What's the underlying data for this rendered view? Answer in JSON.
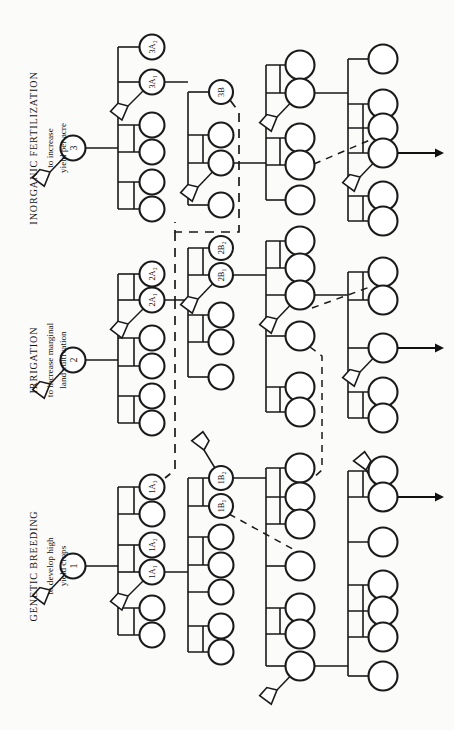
{
  "figure": {
    "kind": "relevance-tree",
    "orientation": "rotated-90-counterclockwise",
    "background_color": "#fbfbfa",
    "ink_color": "#1a1a1a",
    "width": 454,
    "height": 730
  },
  "branches": [
    {
      "id": "branch-3",
      "root_label": "3",
      "title": "INORGANIC  FERTILIZATION",
      "objective_line1": "to increase",
      "objective_line2": "yield per acre",
      "level_a_labels": [
        "3A₂",
        "3A₁"
      ],
      "level_b_labels": [
        "3B"
      ]
    },
    {
      "id": "branch-2",
      "root_label": "2",
      "title": "IRRIGATION",
      "objective_line1": "to increase marginal",
      "objective_line2": "land cultivation",
      "level_a_labels": [
        "2A₂",
        "2A₁"
      ],
      "level_b_labels": [
        "2B₂",
        "2B₁"
      ]
    },
    {
      "id": "branch-1",
      "root_label": "1",
      "title": "GENETIC  BREEDING",
      "objective_line1": "to develop high",
      "objective_line2": "yield crops",
      "level_a_labels": [
        "1A₃",
        "1A₂",
        "1A₁"
      ],
      "level_b_labels": [
        "1B₂",
        "1B₁"
      ]
    }
  ],
  "labeled_nodes": [
    {
      "label": "3",
      "cx": 73,
      "cy": 148,
      "r": 12.5,
      "font": 10
    },
    {
      "label": "3A₂",
      "cx": 152,
      "cy": 47,
      "r": 12.5,
      "font": 8.4
    },
    {
      "label": "3A₁",
      "cx": 152,
      "cy": 82,
      "r": 12.5,
      "font": 8.4
    },
    {
      "label": "3B",
      "cx": 221,
      "cy": 92,
      "r": 12.0,
      "font": 8.4
    },
    {
      "label": "2",
      "cx": 73,
      "cy": 360,
      "r": 12.5,
      "font": 10
    },
    {
      "label": "2A₂",
      "cx": 152,
      "cy": 274,
      "r": 12.5,
      "font": 8.4
    },
    {
      "label": "2A₁",
      "cx": 152,
      "cy": 300,
      "r": 12.5,
      "font": 8.4
    },
    {
      "label": "2B₂",
      "cx": 221,
      "cy": 248,
      "r": 12.0,
      "font": 8.4
    },
    {
      "label": "2B₁",
      "cx": 221,
      "cy": 275,
      "r": 12.0,
      "font": 8.4
    },
    {
      "label": "1",
      "cx": 73,
      "cy": 566,
      "r": 12.5,
      "font": 10
    },
    {
      "label": "1A₃",
      "cx": 152,
      "cy": 487,
      "r": 12.5,
      "font": 8.4
    },
    {
      "label": "1A₂",
      "cx": 152,
      "cy": 545,
      "r": 12.5,
      "font": 8.4
    },
    {
      "label": "1A₁",
      "cx": 152,
      "cy": 572,
      "r": 12.5,
      "font": 8.4
    },
    {
      "label": "1B₂",
      "cx": 221,
      "cy": 478,
      "r": 12.0,
      "font": 8.4
    },
    {
      "label": "1B₁",
      "cx": 221,
      "cy": 506,
      "r": 12.0,
      "font": 8.4
    }
  ],
  "plain_nodes": [
    {
      "cx": 152,
      "cy": 125,
      "r": 12.5
    },
    {
      "cx": 152,
      "cy": 152,
      "r": 12.5
    },
    {
      "cx": 152,
      "cy": 182,
      "r": 12.5
    },
    {
      "cx": 152,
      "cy": 209,
      "r": 12.5
    },
    {
      "cx": 221,
      "cy": 135,
      "r": 12.5
    },
    {
      "cx": 221,
      "cy": 163,
      "r": 12.5
    },
    {
      "cx": 221,
      "cy": 205,
      "r": 12.5
    },
    {
      "cx": 300,
      "cy": 65,
      "r": 14.5
    },
    {
      "cx": 300,
      "cy": 93,
      "r": 14.5
    },
    {
      "cx": 300,
      "cy": 138,
      "r": 14.5
    },
    {
      "cx": 300,
      "cy": 165,
      "r": 14.5
    },
    {
      "cx": 300,
      "cy": 200,
      "r": 14.5
    },
    {
      "cx": 383,
      "cy": 59,
      "r": 14.5
    },
    {
      "cx": 383,
      "cy": 104,
      "r": 14.5
    },
    {
      "cx": 383,
      "cy": 128,
      "r": 14.5
    },
    {
      "cx": 383,
      "cy": 153,
      "r": 14.5
    },
    {
      "cx": 383,
      "cy": 196,
      "r": 14.5
    },
    {
      "cx": 383,
      "cy": 221,
      "r": 14.5
    },
    {
      "cx": 152,
      "cy": 338,
      "r": 12.5
    },
    {
      "cx": 152,
      "cy": 366,
      "r": 12.5
    },
    {
      "cx": 152,
      "cy": 396,
      "r": 12.5
    },
    {
      "cx": 152,
      "cy": 423,
      "r": 12.5
    },
    {
      "cx": 221,
      "cy": 315,
      "r": 12.5
    },
    {
      "cx": 221,
      "cy": 342,
      "r": 12.5
    },
    {
      "cx": 221,
      "cy": 377,
      "r": 12.5
    },
    {
      "cx": 300,
      "cy": 241,
      "r": 14.5
    },
    {
      "cx": 300,
      "cy": 268,
      "r": 14.5
    },
    {
      "cx": 300,
      "cy": 295,
      "r": 14.5
    },
    {
      "cx": 300,
      "cy": 336,
      "r": 14.5
    },
    {
      "cx": 300,
      "cy": 387,
      "r": 14.5
    },
    {
      "cx": 300,
      "cy": 412,
      "r": 14.5
    },
    {
      "cx": 383,
      "cy": 272,
      "r": 14.5
    },
    {
      "cx": 383,
      "cy": 300,
      "r": 14.5
    },
    {
      "cx": 383,
      "cy": 348,
      "r": 14.5
    },
    {
      "cx": 383,
      "cy": 392,
      "r": 14.5
    },
    {
      "cx": 383,
      "cy": 418,
      "r": 14.5
    },
    {
      "cx": 152,
      "cy": 514,
      "r": 12.5
    },
    {
      "cx": 152,
      "cy": 608,
      "r": 12.5
    },
    {
      "cx": 152,
      "cy": 635,
      "r": 12.5
    },
    {
      "cx": 221,
      "cy": 537,
      "r": 12.5
    },
    {
      "cx": 221,
      "cy": 565,
      "r": 12.5
    },
    {
      "cx": 221,
      "cy": 592,
      "r": 12.5
    },
    {
      "cx": 221,
      "cy": 626,
      "r": 12.5
    },
    {
      "cx": 221,
      "cy": 652,
      "r": 12.5
    },
    {
      "cx": 300,
      "cy": 468,
      "r": 14.5
    },
    {
      "cx": 300,
      "cy": 497,
      "r": 14.5
    },
    {
      "cx": 300,
      "cy": 524,
      "r": 14.5
    },
    {
      "cx": 300,
      "cy": 566,
      "r": 14.5
    },
    {
      "cx": 300,
      "cy": 608,
      "r": 14.5
    },
    {
      "cx": 300,
      "cy": 634,
      "r": 14.5
    },
    {
      "cx": 300,
      "cy": 666,
      "r": 14.5
    },
    {
      "cx": 383,
      "cy": 471,
      "r": 14.5
    },
    {
      "cx": 383,
      "cy": 497,
      "r": 14.5
    },
    {
      "cx": 383,
      "cy": 542,
      "r": 14.5
    },
    {
      "cx": 383,
      "cy": 585,
      "r": 14.5
    },
    {
      "cx": 383,
      "cy": 611,
      "r": 14.5
    },
    {
      "cx": 383,
      "cy": 637,
      "r": 14.5
    },
    {
      "cx": 383,
      "cy": 676,
      "r": 14.5
    }
  ],
  "arrows": [
    {
      "x1": 398,
      "y1": 153,
      "x2": 444,
      "y2": 153
    },
    {
      "x1": 398,
      "y1": 348,
      "x2": 444,
      "y2": 348
    },
    {
      "x1": 398,
      "y1": 497,
      "x2": 444,
      "y2": 497
    }
  ],
  "flags": [
    {
      "nx": 73,
      "ny": 148,
      "fx": 50,
      "fy": 172
    },
    {
      "nx": 152,
      "ny": 82,
      "fx": 128,
      "fy": 106
    },
    {
      "nx": 221,
      "ny": 163,
      "fx": 198,
      "fy": 187
    },
    {
      "nx": 300,
      "ny": 93,
      "fx": 277,
      "fy": 117
    },
    {
      "nx": 383,
      "ny": 153,
      "fx": 360,
      "fy": 177
    },
    {
      "nx": 73,
      "ny": 360,
      "fx": 50,
      "fy": 384
    },
    {
      "nx": 152,
      "ny": 300,
      "fx": 128,
      "fy": 324
    },
    {
      "nx": 221,
      "ny": 275,
      "fx": 198,
      "fy": 299
    },
    {
      "nx": 300,
      "ny": 295,
      "fx": 277,
      "fy": 319
    },
    {
      "nx": 383,
      "ny": 348,
      "fx": 360,
      "fy": 372
    },
    {
      "nx": 73,
      "ny": 566,
      "fx": 50,
      "fy": 590
    },
    {
      "nx": 152,
      "ny": 572,
      "fx": 128,
      "fy": 596
    },
    {
      "nx": 221,
      "ny": 478,
      "fx": 204,
      "fy": 450
    },
    {
      "nx": 300,
      "ny": 666,
      "fx": 277,
      "fy": 690
    },
    {
      "nx": 383,
      "ny": 497,
      "fx": 366,
      "fy": 470
    }
  ],
  "labels": [
    {
      "id": "label-branch-3",
      "title": "INORGANIC  FERTILIZATION",
      "sub1": "to increase",
      "sub2": "yield per acre",
      "title_x": 37,
      "title_y": 148,
      "sub1_x": 53,
      "sub1_y": 148,
      "sub2_x": 66,
      "sub2_y": 148
    },
    {
      "id": "label-branch-2",
      "title": "IRRIGATION",
      "sub1": "to increase marginal",
      "sub2": "land cultivation",
      "title_x": 37,
      "title_y": 360,
      "sub1_x": 53,
      "sub1_y": 360,
      "sub2_x": 66,
      "sub2_y": 360
    },
    {
      "id": "label-branch-1",
      "title": "GENETIC  BREEDING",
      "sub1": "to develop high",
      "sub2": "yield crops",
      "title_x": 37,
      "title_y": 566,
      "sub1_x": 53,
      "sub1_y": 566,
      "sub2_x": 66,
      "sub2_y": 566
    }
  ]
}
